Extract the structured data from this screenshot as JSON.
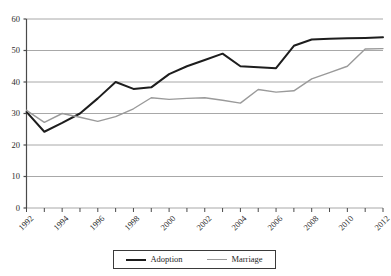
{
  "chart_data": {
    "type": "line",
    "title": "",
    "subtitle": "",
    "xlabel": "",
    "ylabel": "",
    "x": [
      1992,
      1993,
      1994,
      1995,
      1996,
      1997,
      1998,
      1999,
      2000,
      2001,
      2002,
      2003,
      2004,
      2005,
      2006,
      2007,
      2008,
      2009,
      2010,
      2011,
      2012
    ],
    "xlim": [
      1992,
      2012
    ],
    "ylim": [
      0,
      60
    ],
    "ytick_values": [
      0,
      10,
      20,
      30,
      40,
      50,
      60
    ],
    "ytick_labels": [
      "0",
      "10",
      "20",
      "30",
      "40",
      "50",
      "60"
    ],
    "xtick_values": [
      1992,
      1993,
      1994,
      1995,
      1996,
      1997,
      1998,
      1999,
      2000,
      2001,
      2002,
      2003,
      2004,
      2005,
      2006,
      2007,
      2008,
      2009,
      2010,
      2011,
      2012
    ],
    "xtick_labels": [
      "1992",
      "",
      "1994",
      "",
      "1996",
      "",
      "1998",
      "",
      "2000",
      "",
      "2002",
      "",
      "2004",
      "",
      "2006",
      "",
      "2008",
      "",
      "2010",
      "",
      "2012"
    ],
    "grid": "horizontal",
    "legend_position": "bottom-center",
    "series": [
      {
        "name": "Adoption",
        "color": "#1d1d1d",
        "width": 2,
        "values": [
          30.5,
          24.2,
          27.0,
          30.0,
          34.8,
          40.0,
          37.8,
          38.3,
          42.5,
          45.0,
          47.0,
          49.0,
          45.0,
          44.7,
          44.4,
          51.5,
          53.5,
          53.7,
          53.9,
          54.0,
          54.2
        ]
      },
      {
        "name": "Marriage",
        "color": "#9a9a9a",
        "width": 1.4,
        "values": [
          31.0,
          27.2,
          30.0,
          28.8,
          27.5,
          29.0,
          31.5,
          35.0,
          34.5,
          34.8,
          35.0,
          34.2,
          33.3,
          37.6,
          36.8,
          37.2,
          41.0,
          43.0,
          45.0,
          50.5,
          50.6
        ]
      }
    ]
  },
  "legend": {
    "entries": [
      {
        "label": "Adoption",
        "swatch": "adoption-line-swatch"
      },
      {
        "label": "Marriage",
        "swatch": "marriage-line-swatch"
      }
    ]
  },
  "axes": {
    "y_axis_name": "value-axis",
    "x_axis_name": "year-axis"
  },
  "colors": {
    "adoption": "#1d1d1d",
    "marriage": "#9a9a9a",
    "gridline": "#a8a8a8",
    "axis": "#4a4a4a",
    "background": "#ffffff"
  }
}
